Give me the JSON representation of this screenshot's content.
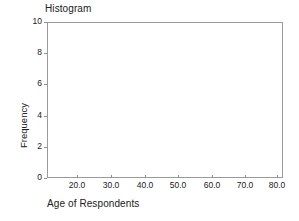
{
  "chart_data": {
    "type": "bar",
    "title": "Histogram",
    "xlabel": "Age of Respondents",
    "ylabel": "Frequency",
    "categories": [],
    "values": [],
    "x_tick_labels": [
      "20.0",
      "30.0",
      "40.0",
      "50.0",
      "60.0",
      "70.0",
      "80.0"
    ],
    "x_tick_values": [
      20.0,
      30.0,
      40.0,
      50.0,
      60.0,
      70.0,
      80.0
    ],
    "y_tick_labels": [
      "0",
      "2",
      "4",
      "6",
      "8",
      "10"
    ],
    "y_tick_values": [
      0,
      2,
      4,
      6,
      8,
      10
    ],
    "xlim": [
      15.0,
      85.0
    ],
    "ylim": [
      0,
      10
    ],
    "grid": false,
    "legend": false
  },
  "chart": {
    "title": "Histogram",
    "x_axis": {
      "title": "Age of Respondents",
      "ticks": [
        {
          "label": "20.0",
          "value": 20.0
        },
        {
          "label": "30.0",
          "value": 30.0
        },
        {
          "label": "40.0",
          "value": 40.0
        },
        {
          "label": "50.0",
          "value": 50.0
        },
        {
          "label": "60.0",
          "value": 60.0
        },
        {
          "label": "70.0",
          "value": 70.0
        },
        {
          "label": "80.0",
          "value": 80.0
        }
      ]
    },
    "y_axis": {
      "title": "Frequency",
      "ticks": [
        {
          "label": "10",
          "value": 10
        },
        {
          "label": "8",
          "value": 8
        },
        {
          "label": "6",
          "value": 6
        },
        {
          "label": "4",
          "value": 4
        },
        {
          "label": "2",
          "value": 2
        },
        {
          "label": "0",
          "value": 0
        }
      ]
    },
    "colors": {
      "background": "#ffffff",
      "frame": "#9a9a9a",
      "text": "#202020",
      "tick": "#8e8e8e"
    }
  }
}
